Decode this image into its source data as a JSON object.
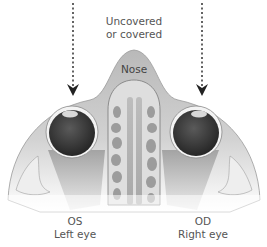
{
  "figure": {
    "type": "anatomical-diagram"
  },
  "labels": {
    "top": [
      "Uncovered",
      "or covered"
    ],
    "nose": "Nose",
    "left_eye": {
      "abbr": "OS",
      "name": "Left eye"
    },
    "right_eye": {
      "abbr": "OD",
      "name": "Right eye"
    }
  },
  "arrows": [
    {
      "id": "left-arrow",
      "style": "dotted",
      "direction": "down",
      "target": "left eye"
    },
    {
      "id": "right-arrow",
      "style": "dotted",
      "direction": "down",
      "target": "right eye"
    }
  ],
  "colors": {
    "background": "#ffffff",
    "tissue": "#c9c9c9",
    "tissue_light": "#e4e4e4",
    "septum_fill": "#d6d6d6",
    "sinus_fill": "#8f8f8f",
    "eyeball": "#3a3a3a",
    "sclera_ring": "#f2f2f2",
    "text": "#555555",
    "arrow": "#222222"
  }
}
